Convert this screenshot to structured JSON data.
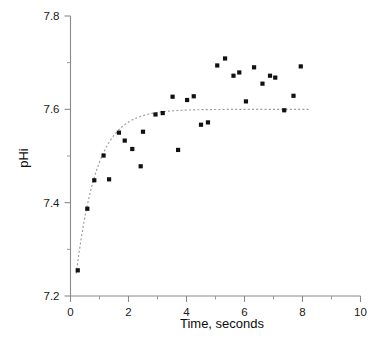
{
  "chart_data": {
    "type": "scatter",
    "title": "",
    "subtitle": "",
    "xlabel": "Time, seconds",
    "ylabel": "pHi",
    "xlim": [
      0,
      10
    ],
    "ylim": [
      7.2,
      7.8
    ],
    "xticks": [
      0,
      2,
      4,
      6,
      8,
      10
    ],
    "xtick_labels": [
      "0",
      "2",
      "4",
      "6",
      "8",
      "10"
    ],
    "xticks_minor": [
      1,
      3,
      5,
      7,
      9
    ],
    "yticks": [
      7.2,
      7.4,
      7.6,
      7.8
    ],
    "ytick_labels": [
      "7.2",
      "7.4",
      "7.6",
      "7.8"
    ],
    "yticks_minor": [
      7.3,
      7.5,
      7.7
    ],
    "grid": false,
    "legend": null,
    "legend_position": "none",
    "marker": "filled-square",
    "marker_color": "#111111",
    "fit_curve_color": "#9b9b9b",
    "fit_curve_style": "dashed",
    "fit_curve_label": "exponential rise to plateau",
    "fit_curve_plateau": 7.6,
    "fit_curve_x_range": [
      0.2,
      8.25
    ],
    "series": [
      {
        "name": "pHi vs time",
        "points": [
          [
            0.25,
            7.255
          ],
          [
            0.58,
            7.387
          ],
          [
            0.82,
            7.448
          ],
          [
            1.14,
            7.501
          ],
          [
            1.33,
            7.45
          ],
          [
            1.67,
            7.55
          ],
          [
            1.87,
            7.533
          ],
          [
            2.13,
            7.515
          ],
          [
            2.42,
            7.478
          ],
          [
            2.5,
            7.552
          ],
          [
            2.93,
            7.589
          ],
          [
            3.18,
            7.592
          ],
          [
            3.52,
            7.627
          ],
          [
            3.71,
            7.513
          ],
          [
            4.02,
            7.62
          ],
          [
            4.25,
            7.628
          ],
          [
            4.5,
            7.567
          ],
          [
            4.74,
            7.572
          ],
          [
            5.06,
            7.694
          ],
          [
            5.33,
            7.709
          ],
          [
            5.62,
            7.672
          ],
          [
            5.82,
            7.679
          ],
          [
            6.05,
            7.617
          ],
          [
            6.33,
            7.69
          ],
          [
            6.62,
            7.655
          ],
          [
            6.88,
            7.672
          ],
          [
            7.06,
            7.668
          ],
          [
            7.37,
            7.598
          ],
          [
            7.69,
            7.629
          ],
          [
            7.94,
            7.692
          ]
        ]
      }
    ],
    "n_points": 30,
    "axis_color": "#8a8a8a"
  },
  "axes": {
    "y_label": "pHi",
    "x_label": "Time, seconds",
    "x_tick_labels": [
      "0",
      "2",
      "4",
      "6",
      "8",
      "10"
    ],
    "y_tick_labels": [
      "7.2",
      "7.4",
      "7.6",
      "7.8"
    ]
  }
}
